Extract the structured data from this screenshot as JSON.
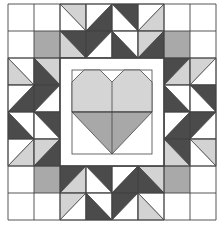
{
  "quilt": {
    "title": "Heart quilt block",
    "grid": {
      "cols": 8,
      "rows": 8,
      "x0": 8,
      "y0": 4,
      "cw": 26,
      "ch": 27
    },
    "colors": {
      "white": "#ffffff",
      "light": "#d3d3d3",
      "medium": "#a9a9a9",
      "dark": "#4b4b4b",
      "line": "#444444",
      "heart_top": "#d5d5d5",
      "heart_bottom": "#a8a8a8"
    },
    "solid_cells": [
      {
        "r": 1,
        "c": 1,
        "fill": "medium"
      },
      {
        "r": 1,
        "c": 6,
        "fill": "medium"
      },
      {
        "r": 6,
        "c": 1,
        "fill": "medium"
      },
      {
        "r": 6,
        "c": 6,
        "fill": "medium"
      }
    ],
    "hst_cells": [
      {
        "r": 0,
        "c": 2,
        "diag": "tlbr",
        "a": "light",
        "b": "white"
      },
      {
        "r": 0,
        "c": 3,
        "diag": "bltr",
        "a": "white",
        "b": "dark"
      },
      {
        "r": 0,
        "c": 4,
        "diag": "tlbr",
        "a": "dark",
        "b": "white"
      },
      {
        "r": 0,
        "c": 5,
        "diag": "bltr",
        "a": "white",
        "b": "light"
      },
      {
        "r": 1,
        "c": 2,
        "diag": "tlbr",
        "a": "dark",
        "b": "light"
      },
      {
        "r": 1,
        "c": 3,
        "diag": "bltr",
        "a": "dark",
        "b": "white"
      },
      {
        "r": 1,
        "c": 4,
        "diag": "tlbr",
        "a": "white",
        "b": "dark"
      },
      {
        "r": 1,
        "c": 5,
        "diag": "bltr",
        "a": "light",
        "b": "dark"
      },
      {
        "r": 2,
        "c": 0,
        "diag": "tlbr",
        "a": "white",
        "b": "light"
      },
      {
        "r": 2,
        "c": 1,
        "diag": "tlbr",
        "a": "light",
        "b": "dark"
      },
      {
        "r": 3,
        "c": 0,
        "diag": "bltr",
        "a": "white",
        "b": "dark"
      },
      {
        "r": 3,
        "c": 1,
        "diag": "bltr",
        "a": "dark",
        "b": "white"
      },
      {
        "r": 4,
        "c": 0,
        "diag": "tlbr",
        "a": "white",
        "b": "dark"
      },
      {
        "r": 4,
        "c": 1,
        "diag": "tlbr",
        "a": "dark",
        "b": "white"
      },
      {
        "r": 5,
        "c": 0,
        "diag": "bltr",
        "a": "white",
        "b": "light"
      },
      {
        "r": 5,
        "c": 1,
        "diag": "bltr",
        "a": "light",
        "b": "dark"
      },
      {
        "r": 2,
        "c": 6,
        "diag": "bltr",
        "a": "dark",
        "b": "light"
      },
      {
        "r": 2,
        "c": 7,
        "diag": "bltr",
        "a": "light",
        "b": "white"
      },
      {
        "r": 3,
        "c": 6,
        "diag": "tlbr",
        "a": "white",
        "b": "dark"
      },
      {
        "r": 3,
        "c": 7,
        "diag": "tlbr",
        "a": "dark",
        "b": "white"
      },
      {
        "r": 4,
        "c": 6,
        "diag": "bltr",
        "a": "white",
        "b": "dark"
      },
      {
        "r": 4,
        "c": 7,
        "diag": "bltr",
        "a": "dark",
        "b": "white"
      },
      {
        "r": 5,
        "c": 6,
        "diag": "tlbr",
        "a": "dark",
        "b": "light"
      },
      {
        "r": 5,
        "c": 7,
        "diag": "tlbr",
        "a": "light",
        "b": "white"
      },
      {
        "r": 6,
        "c": 2,
        "diag": "bltr",
        "a": "dark",
        "b": "light"
      },
      {
        "r": 6,
        "c": 3,
        "diag": "tlbr",
        "a": "dark",
        "b": "white"
      },
      {
        "r": 6,
        "c": 4,
        "diag": "bltr",
        "a": "white",
        "b": "dark"
      },
      {
        "r": 6,
        "c": 5,
        "diag": "tlbr",
        "a": "light",
        "b": "dark"
      },
      {
        "r": 7,
        "c": 2,
        "diag": "bltr",
        "a": "light",
        "b": "white"
      },
      {
        "r": 7,
        "c": 3,
        "diag": "tlbr",
        "a": "white",
        "b": "dark"
      },
      {
        "r": 7,
        "c": 4,
        "diag": "bltr",
        "a": "dark",
        "b": "white"
      },
      {
        "r": 7,
        "c": 5,
        "diag": "tlbr",
        "a": "white",
        "b": "light"
      }
    ],
    "center": {
      "frame": {
        "x": 60,
        "y": 58,
        "w": 104,
        "h": 108
      },
      "inner": {
        "x": 72,
        "y": 70,
        "w": 80,
        "h": 84
      },
      "heart": {
        "top_y": 70,
        "mid_y": 112,
        "tip_y": 154,
        "left_x": 72,
        "right_x": 152,
        "center_x": 112,
        "notch_depth": 12
      }
    }
  }
}
